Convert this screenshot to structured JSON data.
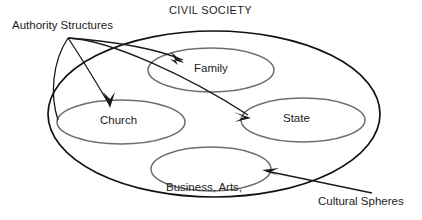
{
  "diagram": {
    "title": "CIVIL SOCIETY",
    "labels": {
      "authority_structures": "Authority Structures",
      "cultural_spheres": "Cultural Spheres"
    },
    "outer_region": {
      "name": "CIVIL SOCIETY",
      "shape": "ellipse"
    },
    "nodes": [
      {
        "id": "family",
        "label": "Family",
        "shape": "ellipse"
      },
      {
        "id": "church",
        "label": "Church",
        "shape": "ellipse"
      },
      {
        "id": "state",
        "label": "State",
        "shape": "ellipse"
      },
      {
        "id": "business",
        "label_line1": "Business, Arts,",
        "label_line2": "Medicine, etc.",
        "shape": "ellipse"
      }
    ],
    "connectors": [
      {
        "from": "authority_structures",
        "to": "family",
        "style": "curved-arrow"
      },
      {
        "from": "authority_structures",
        "to": "church",
        "style": "straight-arrow"
      },
      {
        "from": "authority_structures",
        "to": "state",
        "style": "curved-arrow"
      },
      {
        "from": "cultural_spheres",
        "to": "business",
        "style": "straight-arrow"
      }
    ],
    "colors": {
      "outer_stroke": "#111111",
      "inner_stroke": "#6e6e6e",
      "connector_stroke": "#1a1a1a",
      "text": "#1c1c1c",
      "background": "#ffffff"
    }
  }
}
